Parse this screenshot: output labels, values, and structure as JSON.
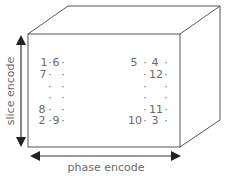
{
  "diagram": {
    "type": "3D volume k-space sampling order",
    "labels": {
      "slice_axis": "slice encode",
      "phase_axis": "phase encode"
    },
    "left_column": {
      "rows": [
        [
          "1",
          "·",
          "6",
          "·"
        ],
        [
          "7",
          "·",
          "",
          "·"
        ],
        [
          "",
          "·",
          "",
          "·"
        ],
        [
          "",
          "·",
          "",
          "·"
        ],
        [
          "8",
          "·",
          "",
          "·"
        ],
        [
          "2",
          "·",
          "9",
          "·"
        ]
      ]
    },
    "right_column": {
      "rows": [
        [
          "5",
          "·",
          "4",
          "·"
        ],
        [
          "",
          "·",
          "12",
          "·"
        ],
        [
          "",
          "·",
          "",
          "·"
        ],
        [
          "",
          "·",
          "",
          "·"
        ],
        [
          "",
          "·",
          "11",
          "·"
        ],
        [
          "10",
          "·",
          "3",
          "·"
        ]
      ]
    },
    "colors": {
      "line": "#555555",
      "arrow": "#222222",
      "text": "#6a6a6a"
    }
  }
}
